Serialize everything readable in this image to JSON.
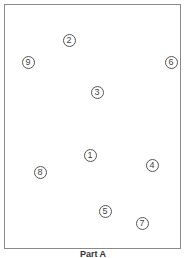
{
  "diagram": {
    "caption": "Part A",
    "markers": [
      {
        "label": "1",
        "x": 90,
        "y": 155
      },
      {
        "label": "2",
        "x": 69,
        "y": 40
      },
      {
        "label": "3",
        "x": 97,
        "y": 92
      },
      {
        "label": "4",
        "x": 152,
        "y": 165
      },
      {
        "label": "5",
        "x": 105,
        "y": 211
      },
      {
        "label": "6",
        "x": 171,
        "y": 62
      },
      {
        "label": "7",
        "x": 142,
        "y": 223
      },
      {
        "label": "8",
        "x": 40,
        "y": 172
      },
      {
        "label": "9",
        "x": 28,
        "y": 62
      }
    ]
  }
}
